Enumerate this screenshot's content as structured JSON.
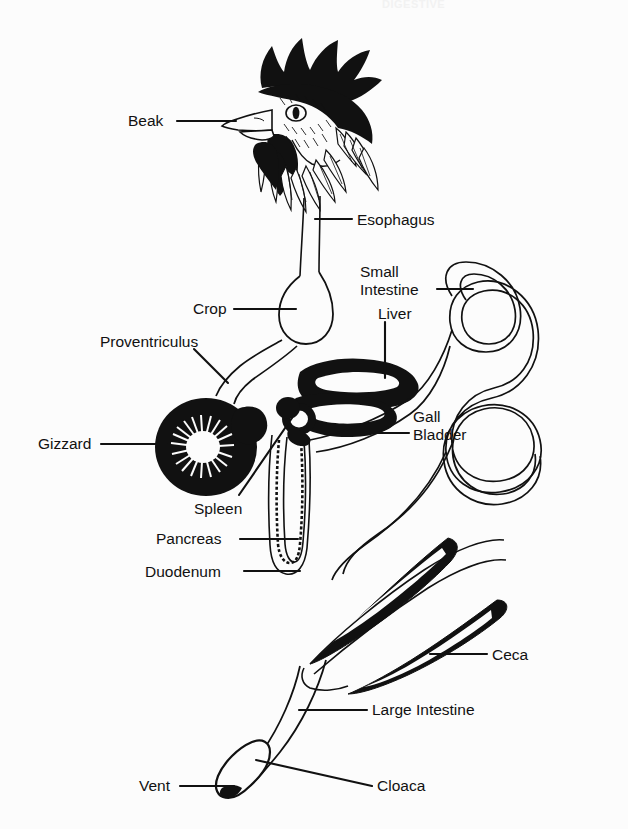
{
  "header": {
    "title": "DIGESTIVE"
  },
  "figure": {
    "background_color": "#fcfcfc",
    "ink_color": "#111111"
  },
  "labels": [
    {
      "id": "beak",
      "text": "Beak",
      "x": 128,
      "y": 112,
      "align": "left"
    },
    {
      "id": "esophagus",
      "text": "Esophagus",
      "x": 357,
      "y": 211,
      "align": "left"
    },
    {
      "id": "small-intestine",
      "text": "Small\nIntestine",
      "x": 360,
      "y": 263,
      "align": "left"
    },
    {
      "id": "crop",
      "text": "Crop",
      "x": 193,
      "y": 300,
      "align": "left"
    },
    {
      "id": "liver",
      "text": "Liver",
      "x": 378,
      "y": 305,
      "align": "left"
    },
    {
      "id": "proventriculus",
      "text": "Proventriculus",
      "x": 100,
      "y": 333,
      "align": "left"
    },
    {
      "id": "gall-bladder",
      "text": "Gall\nBladder",
      "x": 413,
      "y": 408,
      "align": "left"
    },
    {
      "id": "gizzard",
      "text": "Gizzard",
      "x": 38,
      "y": 435,
      "align": "left"
    },
    {
      "id": "spleen",
      "text": "Spleen",
      "x": 194,
      "y": 500,
      "align": "left"
    },
    {
      "id": "pancreas",
      "text": "Pancreas",
      "x": 156,
      "y": 530,
      "align": "left"
    },
    {
      "id": "duodenum",
      "text": "Duodenum",
      "x": 145,
      "y": 563,
      "align": "left"
    },
    {
      "id": "ceca",
      "text": "Ceca",
      "x": 492,
      "y": 646,
      "align": "left"
    },
    {
      "id": "large-intestine",
      "text": "Large Intestine",
      "x": 372,
      "y": 701,
      "align": "left"
    },
    {
      "id": "vent",
      "text": "Vent",
      "x": 139,
      "y": 777,
      "align": "left"
    },
    {
      "id": "cloaca",
      "text": "Cloaca",
      "x": 377,
      "y": 777,
      "align": "left"
    }
  ],
  "parts": [
    {
      "id": "beak",
      "name": "Beak"
    },
    {
      "id": "esophagus",
      "name": "Esophagus"
    },
    {
      "id": "crop",
      "name": "Crop"
    },
    {
      "id": "proventriculus",
      "name": "Proventriculus"
    },
    {
      "id": "gizzard",
      "name": "Gizzard"
    },
    {
      "id": "liver",
      "name": "Liver"
    },
    {
      "id": "gall-bladder",
      "name": "Gall Bladder"
    },
    {
      "id": "spleen",
      "name": "Spleen"
    },
    {
      "id": "pancreas",
      "name": "Pancreas"
    },
    {
      "id": "duodenum",
      "name": "Duodenum"
    },
    {
      "id": "small-intestine",
      "name": "Small Intestine"
    },
    {
      "id": "ceca",
      "name": "Ceca"
    },
    {
      "id": "large-intestine",
      "name": "Large Intestine"
    },
    {
      "id": "cloaca",
      "name": "Cloaca"
    },
    {
      "id": "vent",
      "name": "Vent"
    }
  ]
}
